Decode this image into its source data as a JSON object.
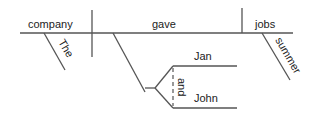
{
  "diagram": {
    "type": "sentence-diagram",
    "words": {
      "subject": "company",
      "subject_modifier": "The",
      "verb": "gave",
      "object": "jobs",
      "object_modifier": "summer",
      "indirect_object_1": "Jan",
      "indirect_object_2": "John",
      "conjunction": "and"
    },
    "colors": {
      "line": "#555555",
      "text": "#222222",
      "background": "#ffffff"
    }
  }
}
